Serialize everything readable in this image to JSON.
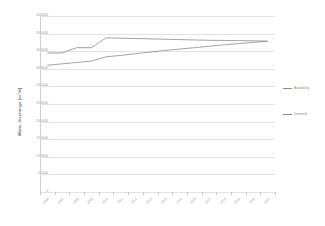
{
  "chart_data": {
    "type": "line",
    "title": "",
    "xlabel": "",
    "ylabel": "Water discharge [m³/d]",
    "ylim": [
      0,
      5000000
    ],
    "ytick_step": 500000,
    "yticks": [
      "5000000",
      "4500000",
      "4000000",
      "3500000",
      "3000000",
      "2500000",
      "2000000",
      "1500000",
      "1000000",
      "500000",
      "0"
    ],
    "ytick_values": [
      5000000,
      4500000,
      4000000,
      3500000,
      3000000,
      2500000,
      2000000,
      1500000,
      1000000,
      500000,
      0
    ],
    "grid": true,
    "legend_position": "right",
    "categories": [
      "2006",
      "2007",
      "2008",
      "2009",
      "2010",
      "2011",
      "2012",
      "2013",
      "2014",
      "2015",
      "2016",
      "2017",
      "2018",
      "2019",
      "2020",
      "2021"
    ],
    "series": [
      {
        "name": "Availability",
        "color": "#8c8c8c",
        "values": [
          3950000,
          3950000,
          4100000,
          4100000,
          4380000,
          4370000,
          4360000,
          4350000,
          4340000,
          4330000,
          4320000,
          4310000,
          4305000,
          4300000,
          4295000,
          4285000
        ]
      },
      {
        "name": "Demand",
        "color": "#8c8c8c",
        "values": [
          3600000,
          3640000,
          3680000,
          3720000,
          3840000,
          3880000,
          3930000,
          3975000,
          4020000,
          4060000,
          4100000,
          4140000,
          4180000,
          4215000,
          4250000,
          4285000
        ]
      }
    ],
    "annotations": []
  },
  "legend": {
    "items": [
      {
        "label": "Availability"
      },
      {
        "label": "Demand"
      }
    ]
  },
  "axis": {
    "y_title": "Water discharge [m³/d]"
  },
  "colors": {
    "series_line": "#8c8c8c",
    "grid": "#e3e3e3",
    "axis": "#cfcfcf",
    "tick_text": "#9a9a9a",
    "background": "#ffffff"
  }
}
